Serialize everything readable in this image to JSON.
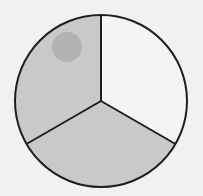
{
  "diagram": {
    "type": "fraction-circle",
    "parts_total": 3,
    "parts_shaded": 2,
    "colors": {
      "background": "#f1f1f1",
      "shaded": "#c9c9c9",
      "unshaded": "#f4f4f4",
      "outline": "#1e1e1e",
      "smudge": "#adadad"
    },
    "sectors": [
      {
        "name": "upper-left",
        "shaded": true
      },
      {
        "name": "right",
        "shaded": false
      },
      {
        "name": "bottom",
        "shaded": true
      }
    ]
  }
}
